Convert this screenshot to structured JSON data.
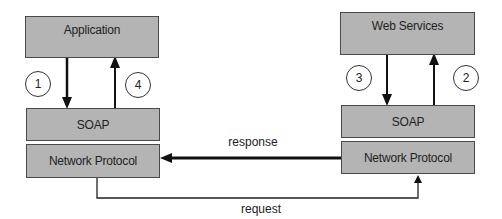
{
  "diagram": {
    "client": {
      "application_label": "Application",
      "soap_label": "SOAP",
      "network_label": "Network Protocol",
      "step_down": "1",
      "step_up": "4"
    },
    "server": {
      "webservices_label": "Web Services",
      "soap_label": "SOAP",
      "network_label": "Network Protocol",
      "step_down": "3",
      "step_up": "2"
    },
    "connections": {
      "response_label": "response",
      "request_label": "request"
    },
    "colors": {
      "box_fill": "#b4b4b4",
      "box_border": "#4a4a4a",
      "line": "#111111",
      "background": "#ffffff"
    }
  }
}
